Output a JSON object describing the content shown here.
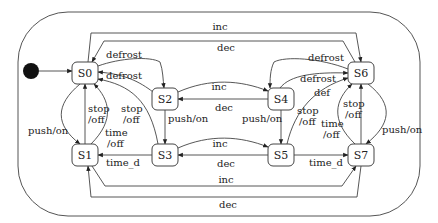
{
  "diagram": {
    "type": "statechart",
    "states": [
      {
        "id": "S0",
        "label": "S0"
      },
      {
        "id": "S1",
        "label": "S1"
      },
      {
        "id": "S2",
        "label": "S2"
      },
      {
        "id": "S3",
        "label": "S3"
      },
      {
        "id": "S4",
        "label": "S4"
      },
      {
        "id": "S5",
        "label": "S5"
      },
      {
        "id": "S6",
        "label": "S6"
      },
      {
        "id": "S7",
        "label": "S7"
      }
    ],
    "initial_state": "S0",
    "labels": {
      "top_inc": "inc",
      "top_dec": "dec",
      "bottom_inc": "inc",
      "bottom_dec": "dec",
      "s0_s2_defrost": "defrost",
      "s2_s0_defrost": "defrost",
      "s4_s6_defrost": "defrost",
      "s6_s4_defrost": "defrost",
      "s2_s4_inc": "inc",
      "s4_s2_dec": "dec",
      "s3_s5_inc": "inc",
      "s5_s3_dec": "dec",
      "s0_s1_push": "push/on",
      "s2_s3_push": "push/on",
      "s4_s5_push": "push/on",
      "s6_s7_push": "push/on",
      "s1_s0_stop_a": "stop",
      "s1_s0_stop_b": "/off",
      "s3_s0_stop_a": "stop",
      "s3_s0_stop_b": "/off",
      "s1_s0_time_a": "time",
      "s1_s0_time_b": "/off",
      "s3_s1_time_d": "time_d",
      "s5_s6_def": "def",
      "s5_s6_stop_a": "stop",
      "s5_s6_stop_b": "/off",
      "s7_s6_stop_a": "stop",
      "s7_s6_stop_b": "/off",
      "s7_s6_time_a": "time",
      "s7_s6_time_b": "/off",
      "s5_s7_time_d": "time_d"
    },
    "transitions": [
      {
        "from": "S0",
        "to": "S6",
        "label": "inc"
      },
      {
        "from": "S6",
        "to": "S0",
        "label": "dec"
      },
      {
        "from": "S1",
        "to": "S7",
        "label": "inc"
      },
      {
        "from": "S7",
        "to": "S1",
        "label": "dec"
      },
      {
        "from": "S0",
        "to": "S2",
        "label": "defrost"
      },
      {
        "from": "S2",
        "to": "S0",
        "label": "defrost"
      },
      {
        "from": "S6",
        "to": "S4",
        "label": "defrost"
      },
      {
        "from": "S4",
        "to": "S6",
        "label": "defrost"
      },
      {
        "from": "S2",
        "to": "S4",
        "label": "inc"
      },
      {
        "from": "S4",
        "to": "S2",
        "label": "dec"
      },
      {
        "from": "S3",
        "to": "S5",
        "label": "inc"
      },
      {
        "from": "S5",
        "to": "S3",
        "label": "dec"
      },
      {
        "from": "S0",
        "to": "S1",
        "label": "push/on"
      },
      {
        "from": "S2",
        "to": "S3",
        "label": "push/on"
      },
      {
        "from": "S4",
        "to": "S5",
        "label": "push/on"
      },
      {
        "from": "S6",
        "to": "S7",
        "label": "push/on"
      },
      {
        "from": "S1",
        "to": "S0",
        "label": "stop/off"
      },
      {
        "from": "S1",
        "to": "S0",
        "label": "time/off"
      },
      {
        "from": "S3",
        "to": "S0",
        "label": "stop/off"
      },
      {
        "from": "S3",
        "to": "S1",
        "label": "time_d"
      },
      {
        "from": "S5",
        "to": "S6",
        "label": "def"
      },
      {
        "from": "S5",
        "to": "S6",
        "label": "stop/off"
      },
      {
        "from": "S7",
        "to": "S6",
        "label": "stop/off"
      },
      {
        "from": "S7",
        "to": "S6",
        "label": "time/off"
      },
      {
        "from": "S5",
        "to": "S7",
        "label": "time_d"
      }
    ]
  }
}
